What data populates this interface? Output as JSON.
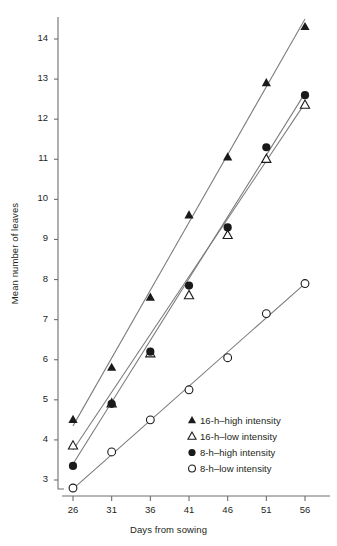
{
  "chart_data": {
    "type": "scatter",
    "title": "",
    "xlabel": "Days from sowing",
    "ylabel": "Mean number of leaves",
    "x": [
      26,
      31,
      36,
      41,
      46,
      51,
      56
    ],
    "xticks": [
      "26",
      "31",
      "36",
      "41",
      "46",
      "51",
      "56"
    ],
    "yticks": [
      "3",
      "4",
      "5",
      "6",
      "7",
      "8",
      "9",
      "10",
      "11",
      "12",
      "13",
      "14"
    ],
    "xlim": [
      23.5,
      58.5
    ],
    "ylim": [
      2.6,
      14.6
    ],
    "grid": false,
    "legend_position": "inside-lower-right",
    "series": [
      {
        "name": "16-h–high intensity",
        "marker": "filled-triangle",
        "color": "#1a1a1a",
        "values": [
          4.5,
          5.8,
          7.55,
          9.6,
          11.05,
          12.9,
          14.3
        ],
        "fit_line": {
          "x0": 26,
          "y0": 4.35,
          "x1": 56,
          "y1": 14.5
        }
      },
      {
        "name": "16-h–low intensity",
        "marker": "open-triangle",
        "color": "#1a1a1a",
        "values": [
          3.85,
          4.9,
          6.15,
          7.6,
          9.1,
          11.0,
          12.35
        ],
        "fit_line": {
          "x0": 26,
          "y0": 3.75,
          "x1": 56,
          "y1": 12.4
        }
      },
      {
        "name": "8-h–high intensity",
        "marker": "filled-circle",
        "color": "#1a1a1a",
        "values": [
          3.35,
          4.9,
          6.2,
          7.85,
          9.3,
          11.3,
          12.6
        ],
        "fit_line": {
          "x0": 26,
          "y0": 3.4,
          "x1": 56,
          "y1": 12.65
        }
      },
      {
        "name": "8-h–low intensity",
        "marker": "open-circle",
        "color": "#1a1a1a",
        "values": [
          2.8,
          3.7,
          4.5,
          5.25,
          6.05,
          7.15,
          7.9
        ],
        "fit_line": {
          "x0": 26,
          "y0": 2.78,
          "x1": 56,
          "y1": 7.9
        }
      }
    ]
  },
  "legend": {
    "items": [
      {
        "label": "16-h–high intensity",
        "marker": "filled-triangle"
      },
      {
        "label": "16-h–low intensity",
        "marker": "open-triangle"
      },
      {
        "label": "8-h–high intensity",
        "marker": "filled-circle"
      },
      {
        "label": "8-h–low intensity",
        "marker": "open-circle"
      }
    ]
  },
  "axes": {
    "x_title": "Days from sowing",
    "y_title": "Mean number of leaves"
  },
  "colors": {
    "ink": "#231f20",
    "marker": "#1a1a1a",
    "axis": "#6e6e6e",
    "line": "#7a7a7a",
    "background": "#ffffff"
  }
}
